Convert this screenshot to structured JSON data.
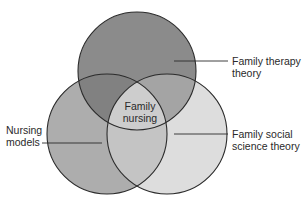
{
  "diagram": {
    "type": "venn",
    "sets": [
      {
        "id": "family_therapy",
        "label_lines": [
          "Family therapy",
          "theory"
        ],
        "position": "top",
        "fill": "#8b8b8b"
      },
      {
        "id": "nursing_models",
        "label_lines": [
          "Nursing",
          "models"
        ],
        "position": "bottom-left",
        "fill": "#adadad"
      },
      {
        "id": "family_social_science",
        "label_lines": [
          "Family social",
          "science theory"
        ],
        "position": "bottom-right",
        "fill": "#dddddd"
      }
    ],
    "intersection": {
      "label_lines": [
        "Family",
        "nursing"
      ],
      "fill": "#cdcdcd"
    },
    "overlap_fills": {
      "top_left": "#818181",
      "top_right": "#a4a4a4",
      "left_right": "#c4c4c4"
    },
    "stroke_color": "#2b2b2b"
  }
}
